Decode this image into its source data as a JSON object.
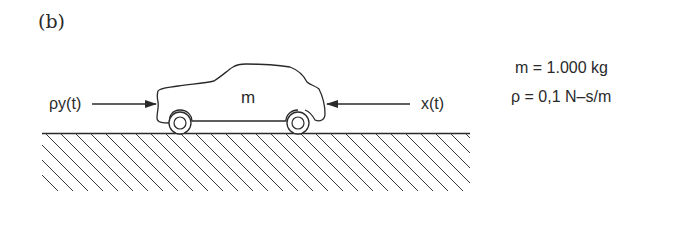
{
  "figure": {
    "panel_label": "(b)",
    "mass_label": "m",
    "left_force_label": "ρy(t)",
    "right_force_label": "x(t)",
    "parameters": [
      {
        "text": "m = 1.000 kg"
      },
      {
        "text": "ρ = 0,1 N–s/m"
      }
    ],
    "elements": {
      "car": "car-outline",
      "ground": "hatched-ground",
      "left_arrow": "arrow-right-icon",
      "right_arrow": "arrow-left-icon"
    },
    "colors": {
      "ink": "#2a2a2a",
      "background": "#ffffff"
    }
  }
}
